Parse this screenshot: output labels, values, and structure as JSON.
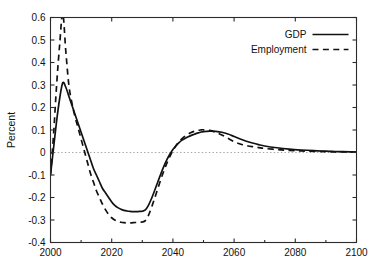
{
  "chart_data": {
    "type": "line",
    "title": "",
    "xlabel": "",
    "ylabel": "Percent",
    "xlim": [
      2000,
      2100
    ],
    "ylim": [
      -0.4,
      0.6
    ],
    "xticks": [
      2000,
      2020,
      2040,
      2060,
      2080,
      2100
    ],
    "xtick_labels": [
      "2000",
      "2020",
      "2040",
      "2060",
      "2080",
      "2100"
    ],
    "yticks": [
      -0.4,
      -0.3,
      -0.2,
      -0.1,
      0,
      0.1,
      0.2,
      0.3,
      0.4,
      0.5,
      0.6
    ],
    "ytick_labels": [
      "-0.4",
      "-0.3",
      "-0.2",
      "-0.1",
      "0",
      "0.1",
      "0.2",
      "0.3",
      "0.4",
      "0.5",
      "0.6"
    ],
    "grid": false,
    "zero_reference_line": 0,
    "legend_position": "top-right",
    "legend_entries": [
      {
        "name": "GDP",
        "style": "solid"
      },
      {
        "name": "Employment",
        "style": "dashed"
      }
    ],
    "x": [
      2000,
      2001,
      2002,
      2003,
      2004,
      2005,
      2006,
      2007,
      2008,
      2009,
      2010,
      2011,
      2012,
      2013,
      2014,
      2015,
      2016,
      2017,
      2018,
      2019,
      2020,
      2021,
      2022,
      2023,
      2024,
      2025,
      2026,
      2027,
      2028,
      2029,
      2030,
      2031,
      2032,
      2033,
      2034,
      2035,
      2036,
      2037,
      2038,
      2039,
      2040,
      2041,
      2042,
      2043,
      2044,
      2045,
      2046,
      2047,
      2048,
      2049,
      2050,
      2052,
      2054,
      2056,
      2058,
      2060,
      2062,
      2064,
      2066,
      2068,
      2070,
      2074,
      2078,
      2082,
      2086,
      2090,
      2094,
      2098,
      2100
    ],
    "series": [
      {
        "name": "GDP",
        "style": "solid",
        "values": [
          -0.1,
          0.02,
          0.14,
          0.24,
          0.31,
          0.29,
          0.25,
          0.21,
          0.17,
          0.13,
          0.09,
          0.05,
          0.01,
          -0.03,
          -0.07,
          -0.1,
          -0.13,
          -0.16,
          -0.18,
          -0.2,
          -0.22,
          -0.235,
          -0.245,
          -0.252,
          -0.257,
          -0.26,
          -0.262,
          -0.263,
          -0.263,
          -0.262,
          -0.261,
          -0.255,
          -0.235,
          -0.205,
          -0.17,
          -0.133,
          -0.097,
          -0.063,
          -0.033,
          -0.008,
          0.013,
          0.03,
          0.044,
          0.055,
          0.063,
          0.07,
          0.076,
          0.081,
          0.086,
          0.09,
          0.093,
          0.095,
          0.094,
          0.09,
          0.082,
          0.071,
          0.06,
          0.05,
          0.042,
          0.035,
          0.029,
          0.021,
          0.015,
          0.011,
          0.008,
          0.006,
          0.004,
          0.003,
          0.002
        ]
      },
      {
        "name": "Employment",
        "style": "dashed",
        "values": [
          -0.1,
          0.08,
          0.3,
          0.48,
          0.62,
          0.45,
          0.3,
          0.22,
          0.16,
          0.11,
          0.06,
          0.01,
          -0.04,
          -0.09,
          -0.13,
          -0.17,
          -0.2,
          -0.23,
          -0.255,
          -0.275,
          -0.29,
          -0.3,
          -0.306,
          -0.31,
          -0.312,
          -0.313,
          -0.313,
          -0.312,
          -0.311,
          -0.31,
          -0.309,
          -0.303,
          -0.28,
          -0.245,
          -0.205,
          -0.163,
          -0.122,
          -0.083,
          -0.048,
          -0.018,
          0.008,
          0.03,
          0.048,
          0.062,
          0.073,
          0.082,
          0.089,
          0.094,
          0.098,
          0.1,
          0.101,
          0.098,
          0.09,
          0.078,
          0.063,
          0.048,
          0.038,
          0.031,
          0.026,
          0.022,
          0.018,
          0.013,
          0.009,
          0.007,
          0.005,
          0.004,
          0.003,
          0.002,
          0.001
        ]
      }
    ]
  }
}
